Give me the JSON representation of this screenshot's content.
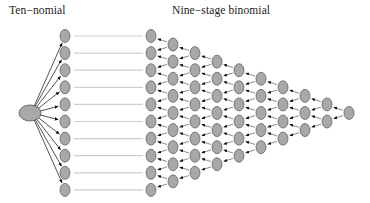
{
  "figure": {
    "width": 370,
    "height": 203,
    "background": "#ffffff"
  },
  "panels": {
    "left": {
      "title": "Ten−nomial",
      "title_x": 9,
      "title_y": 4,
      "type": "multinomial-fan",
      "branches": 10,
      "root": {
        "x": 30,
        "y": 113,
        "rx": 11,
        "ry": 8,
        "fill": "#a8a8a8",
        "stroke": "#555555"
      },
      "column_x": 65,
      "node_top_y": 36,
      "node_spacing": 17.1
    },
    "right": {
      "title": "Nine−stage binomial",
      "title_x": 172,
      "title_y": 4,
      "type": "recombining-binomial-lattice",
      "stages": 9,
      "columns": 10,
      "column_start_x": 151,
      "column_spacing": 22,
      "node_top_y": 36,
      "node_spacing": 17.1,
      "nodes_per_column": [
        10,
        9,
        8,
        7,
        6,
        5,
        4,
        3,
        2,
        1
      ]
    }
  },
  "connectors": {
    "count": 10,
    "from_x": 74,
    "to_x": 143,
    "color": "#cfcfcf",
    "width": 1.2
  },
  "style": {
    "node_fill": "#a8a8a8",
    "node_stroke": "#555555",
    "node_rx": 5,
    "node_ry": 6.5,
    "edge_color": "#6b6b6b",
    "edge_width": 0.8,
    "arrow_color": "#111111",
    "fan_arrow_color": "#111111",
    "fan_edge_color": "#333333",
    "text_color": "#1a1a1a"
  }
}
